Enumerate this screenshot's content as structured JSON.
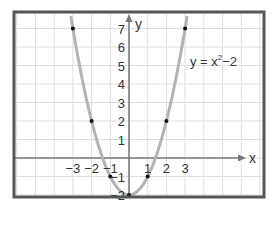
{
  "chart_data": {
    "type": "line",
    "title": "",
    "function": "y = x^2 - 2",
    "equation_label": {
      "base": "y = x",
      "exp": "2",
      "tail": "−2"
    },
    "xlabel": "x",
    "ylabel": "y",
    "xlim": [
      -6.2,
      7.2
    ],
    "ylim": [
      -2.1,
      7.9
    ],
    "grid": true,
    "x_ticks": [
      "−3",
      "−2",
      "−1",
      "1",
      "2",
      "3"
    ],
    "x_tick_values": [
      -3,
      -2,
      -1,
      1,
      2,
      3
    ],
    "y_ticks": [
      "7",
      "6",
      "5",
      "4",
      "3",
      "2",
      "1",
      "−1",
      "−2"
    ],
    "y_tick_values": [
      7,
      6,
      5,
      4,
      3,
      2,
      1,
      -1,
      -2
    ],
    "points": [
      {
        "x": -3,
        "y": 7
      },
      {
        "x": -2,
        "y": 2
      },
      {
        "x": -1,
        "y": -1
      },
      {
        "x": 0,
        "y": -2
      },
      {
        "x": 1,
        "y": -1
      },
      {
        "x": 2,
        "y": 2
      },
      {
        "x": 3,
        "y": 7
      }
    ],
    "curve_x_range": [
      -3.1,
      3.1
    ],
    "colors": {
      "curve": "#b3b3b3",
      "points": "#111111",
      "axes": "#777777",
      "grid": "#dddddd",
      "frame": "#555555"
    }
  }
}
